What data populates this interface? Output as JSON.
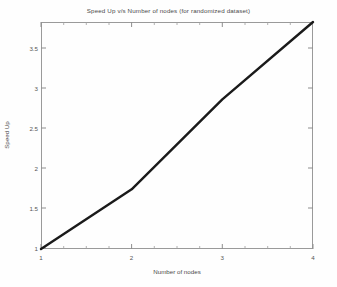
{
  "chart_data": {
    "type": "line",
    "title": "Speed Up v/s Number of nodes (for randomized dataset)",
    "xlabel": "Number of nodes",
    "ylabel": "Speed Up",
    "xlim": [
      1,
      4
    ],
    "ylim": [
      1,
      3.7
    ],
    "grid": false,
    "legend": null,
    "x": [
      1,
      2,
      3,
      4
    ],
    "y": [
      1,
      1.71,
      2.78,
      3.7
    ],
    "series": [
      {
        "name": "Speed Up",
        "x": [
          1,
          2,
          3,
          4
        ],
        "values": [
          1,
          1.71,
          2.78,
          3.7
        ],
        "color": "#1a1a1a",
        "linewidth": 2.4
      }
    ],
    "xticks": [
      1,
      2,
      3,
      4
    ],
    "xtick_labels": [
      "1",
      "2",
      "3",
      "4"
    ],
    "xminor_ticks": [
      1.25,
      1.5,
      1.75,
      2.25,
      2.5,
      2.75,
      3.25,
      3.5,
      3.75
    ],
    "yticks": [
      1,
      1.5,
      2,
      2.5,
      3,
      3.5
    ],
    "ytick_labels": [
      "1",
      "1.5",
      "2",
      "2.5",
      "3",
      "3.5"
    ],
    "axes_color": "#9a9a9a",
    "background_color": "#fefefe"
  },
  "axis": {
    "ytick_labels": [
      "3.5",
      "3",
      "2.5",
      "2",
      "1.5",
      "1"
    ],
    "xtick_labels": [
      "1",
      "2",
      "3",
      "4"
    ]
  }
}
